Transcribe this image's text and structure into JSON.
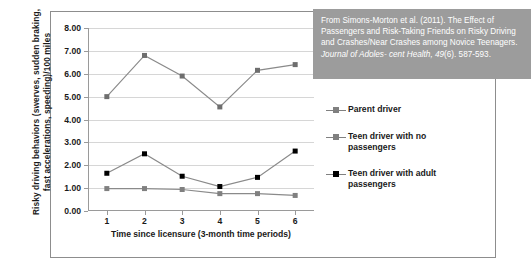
{
  "citation": {
    "line1": "From Simons-Morton et al. (2011). The Effect",
    "line2": "of Passengers and Risk-Taking Friends on",
    "line3": "Risky Driving and Crashes/Near Crashes",
    "line4_plain": "among Novice Teenagers. ",
    "line4_italic": "Journal of Adoles-",
    "line5_italic": "cent Health, 49",
    "line5_plain": "(6). 587-593."
  },
  "legend": {
    "items": [
      {
        "label": "Parent driver",
        "marker_color": "#808080",
        "line_color": "#808080"
      },
      {
        "label": "Teen driver with no passengers",
        "marker_color": "#808080",
        "line_color": "#808080"
      },
      {
        "label": "Teen driver with adult passengers",
        "marker_color": "#000000",
        "line_color": "#808080"
      }
    ]
  },
  "chart_data": {
    "type": "line",
    "title": "",
    "xlabel": "Time since licensure (3-month time periods)",
    "ylabel": "Risky driving behaviors (swerves, sudden braking, fast accelerations, speeding)/100 miles",
    "ylabel_line1": "Risky driving behaviors (swerves, sudden braking,",
    "ylabel_line2": "fast accelerations, speeding)/100 miles",
    "x": [
      1,
      2,
      3,
      4,
      5,
      6
    ],
    "categories": [
      "1",
      "2",
      "3",
      "4",
      "5",
      "6"
    ],
    "xticklabels": [
      "1",
      "2",
      "3",
      "4",
      "5",
      "6"
    ],
    "yticklabels": [
      "0.00",
      "1.00",
      "2.00",
      "3.00",
      "4.00",
      "5.00",
      "6.00",
      "7.00",
      "8.00"
    ],
    "yticks": [
      0,
      1,
      2,
      3,
      4,
      5,
      6,
      7,
      8
    ],
    "ylim": [
      0,
      8
    ],
    "xlim": [
      0.5,
      6.5
    ],
    "grid": true,
    "legend_position": "right",
    "series": [
      {
        "name": "Teen driver with no passengers",
        "values": [
          5.0,
          6.8,
          5.9,
          4.55,
          6.15,
          6.4
        ],
        "marker_color": "#6e6e6e",
        "line_color": "#8a8a8a"
      },
      {
        "name": "Teen driver with adult passengers",
        "values": [
          1.65,
          2.5,
          1.52,
          1.07,
          1.47,
          2.62
        ],
        "marker_color": "#000000",
        "line_color": "#8a8a8a"
      },
      {
        "name": "Parent driver",
        "values": [
          0.98,
          0.98,
          0.94,
          0.76,
          0.76,
          0.68
        ],
        "marker_color": "#808080",
        "line_color": "#8a8a8a"
      }
    ]
  }
}
